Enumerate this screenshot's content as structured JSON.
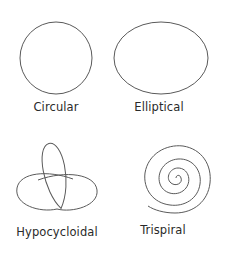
{
  "figure": {
    "panels": [
      {
        "id": "circular",
        "label": "Circular",
        "shape": "circle"
      },
      {
        "id": "elliptical",
        "label": "Elliptical",
        "shape": "ellipse"
      },
      {
        "id": "hypocycloidal",
        "label": "Hypocycloidal",
        "shape": "trefoil"
      },
      {
        "id": "trispiral",
        "label": "Trispiral",
        "shape": "spiral"
      }
    ],
    "stroke_color": "#5a5a5a",
    "text_color": "#2a2a2a",
    "background": "#ffffff"
  }
}
